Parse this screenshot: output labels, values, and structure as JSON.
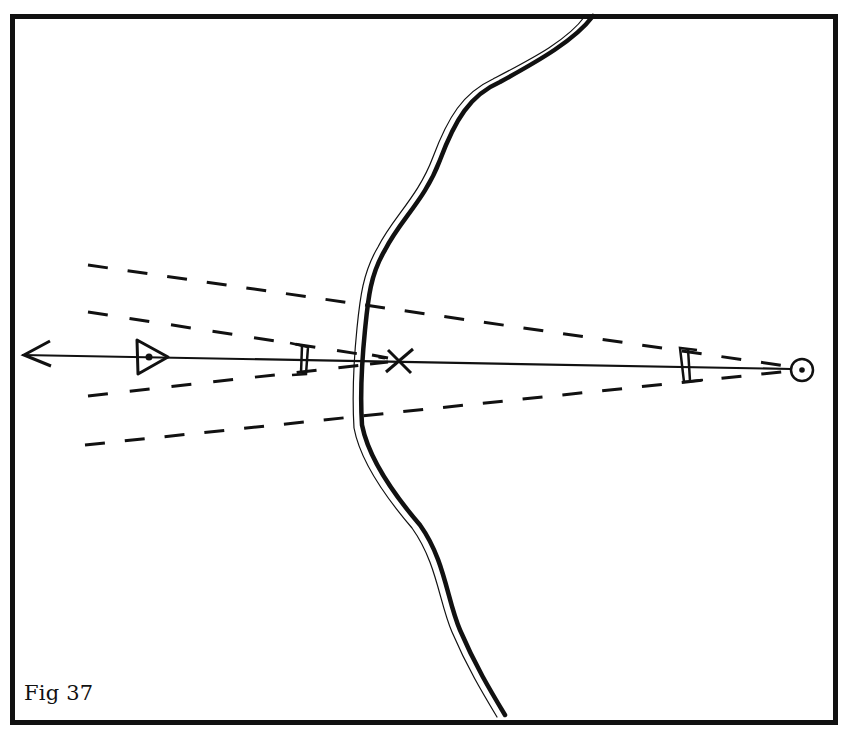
{
  "figure": {
    "caption": "Fig 37",
    "colors": {
      "ink": "#111111",
      "paper": "#ffffff"
    },
    "frame": {
      "x": 10,
      "y": 14,
      "width": 828,
      "height": 711,
      "stroke_width": 5
    },
    "elements": {
      "bearing_line": {
        "from": [
          22,
          355
        ],
        "to": [
          791,
          369
        ],
        "arrow_at": "left"
      },
      "start_point": {
        "symbol": "circle-with-dot",
        "cx": 802,
        "cy": 370,
        "r": 11
      },
      "triangle_marker": {
        "symbol": "triangle-with-dot",
        "points": [
          [
            137,
            340
          ],
          [
            170,
            357
          ],
          [
            137,
            375
          ]
        ],
        "dot": [
          149,
          357
        ]
      },
      "target_cross": {
        "symbol": "x-mark",
        "cx": 400,
        "cy": 361
      },
      "near_bracket": {
        "symbol": "double-bracket",
        "x": 298,
        "y": 345
      },
      "far_bracket": {
        "symbol": "double-bracket",
        "x": 682,
        "y": 348
      },
      "river": {
        "symbol": "double-line-river",
        "top": [
          595,
          14
        ],
        "bottom": [
          500,
          718
        ]
      },
      "error_cone_outer": {
        "style": "dashed",
        "apex": [
          800,
          369
        ],
        "ends": [
          [
            88,
            265
          ],
          [
            85,
            445
          ]
        ]
      },
      "error_cone_inner": {
        "style": "dashed",
        "apex": [
          390,
          360
        ],
        "ends": [
          [
            88,
            312
          ],
          [
            88,
            396
          ]
        ]
      }
    }
  }
}
